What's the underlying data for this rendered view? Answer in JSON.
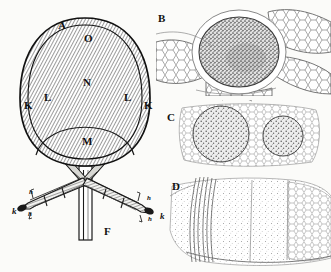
{
  "figure": {
    "kind": "scientific-plate-engraving",
    "background_color": "#fbfbf9",
    "ink_color": "#1a1a1a",
    "panels": [
      {
        "id": "A",
        "letter": "A",
        "type": "line-diagram",
        "description": "oval double-walled frame on a forked stalk with two crossing arms",
        "labels": [
          {
            "text": "A",
            "x": 58,
            "y": 20,
            "style": "panel-letter"
          },
          {
            "text": "O",
            "x": 84,
            "y": 33,
            "style": "part-cap"
          },
          {
            "text": "N",
            "x": 83,
            "y": 77,
            "style": "part-cap"
          },
          {
            "text": "L",
            "x": 44,
            "y": 92,
            "style": "part-cap"
          },
          {
            "text": "L",
            "x": 124,
            "y": 92,
            "style": "part-cap"
          },
          {
            "text": "K",
            "x": 24,
            "y": 100,
            "style": "part-cap"
          },
          {
            "text": "K",
            "x": 144,
            "y": 100,
            "style": "part-cap"
          },
          {
            "text": "M",
            "x": 82,
            "y": 136,
            "style": "part-cap"
          },
          {
            "text": "F",
            "x": 104,
            "y": 226,
            "style": "part-cap"
          },
          {
            "text": "k",
            "x": 12,
            "y": 207,
            "style": "part-low"
          },
          {
            "text": "k",
            "x": 160,
            "y": 212,
            "style": "part-low"
          },
          {
            "text": "h",
            "x": 29,
            "y": 189,
            "style": "part-tiny"
          },
          {
            "text": "h",
            "x": 28,
            "y": 211,
            "style": "part-tiny"
          },
          {
            "text": "h",
            "x": 147,
            "y": 195,
            "style": "part-tiny"
          },
          {
            "text": "h",
            "x": 148,
            "y": 216,
            "style": "part-tiny"
          }
        ]
      },
      {
        "id": "B",
        "letter": "B",
        "type": "micrograph-section",
        "description": "dark stippled ovoid body surrounded by polygonal parenchyma cells",
        "labels": [
          {
            "text": "B",
            "x": 158,
            "y": 13,
            "style": "panel-letter"
          }
        ]
      },
      {
        "id": "C",
        "letter": "C",
        "type": "micrograph-section",
        "description": "two rounded stippled cell clusters in a cellular matrix",
        "labels": [
          {
            "text": "C",
            "x": 167,
            "y": 112,
            "style": "panel-letter"
          }
        ]
      },
      {
        "id": "D",
        "letter": "D",
        "type": "micrograph-section",
        "description": "pale stippled tissue block with vertical fibre bundle at left",
        "labels": [
          {
            "text": "D",
            "x": 172,
            "y": 181,
            "style": "panel-letter"
          }
        ]
      }
    ]
  }
}
